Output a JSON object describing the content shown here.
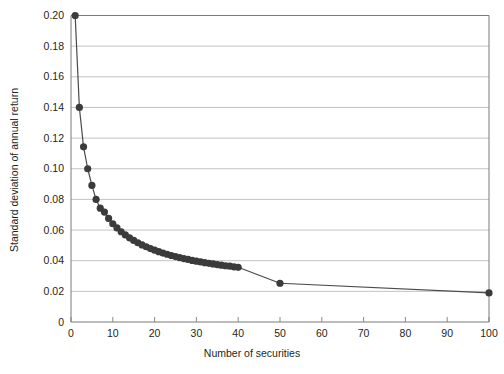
{
  "chart_data": {
    "type": "line",
    "title": "",
    "xlabel": "Number of securities",
    "ylabel": "Standard deviation of annual return",
    "xlim": [
      0,
      100
    ],
    "ylim": [
      0,
      0.2
    ],
    "grid": "horizontal",
    "legend": "none",
    "marker": "filled-circle",
    "marker_color": "#3b3b3b",
    "line_color": "#4a4a4a",
    "gridline_color": "#b3b3b3",
    "axis_color": "#7a7a7a",
    "background": "#ffffff",
    "xticks": [
      0,
      10,
      20,
      30,
      40,
      50,
      60,
      70,
      80,
      90,
      100
    ],
    "xtick_labels": [
      "0",
      "10",
      "20",
      "30",
      "40",
      "50",
      "60",
      "70",
      "80",
      "90",
      "100"
    ],
    "yticks": [
      0,
      0.02,
      0.04,
      0.06,
      0.08,
      0.1,
      0.12,
      0.14,
      0.16,
      0.18,
      0.2
    ],
    "ytick_labels": [
      "0",
      "0.02",
      "0.04",
      "0.06",
      "0.08",
      "0.10",
      "0.12",
      "0.14",
      "0.16",
      "0.18",
      "0.20"
    ],
    "x": [
      1,
      2,
      3,
      4,
      5,
      6,
      7,
      8,
      9,
      10,
      11,
      12,
      13,
      14,
      15,
      16,
      17,
      18,
      19,
      20,
      21,
      22,
      23,
      24,
      25,
      26,
      27,
      28,
      29,
      30,
      31,
      32,
      33,
      34,
      35,
      36,
      37,
      38,
      39,
      40,
      50,
      100
    ],
    "y": [
      0.2,
      0.14,
      0.1143,
      0.1,
      0.0891,
      0.08,
      0.0743,
      0.0717,
      0.0676,
      0.0641,
      0.0614,
      0.0589,
      0.0568,
      0.0549,
      0.0532,
      0.0517,
      0.0503,
      0.0491,
      0.0479,
      0.0469,
      0.0459,
      0.045,
      0.0442,
      0.0434,
      0.0427,
      0.042,
      0.0414,
      0.0408,
      0.0402,
      0.0397,
      0.0392,
      0.0387,
      0.0383,
      0.0379,
      0.0375,
      0.0371,
      0.0367,
      0.0364,
      0.036,
      0.0357,
      0.0253,
      0.019
    ],
    "series": [
      {
        "name": "Portfolio standard deviation",
        "x": [
          1,
          2,
          3,
          4,
          5,
          6,
          7,
          8,
          9,
          10,
          11,
          12,
          13,
          14,
          15,
          16,
          17,
          18,
          19,
          20,
          21,
          22,
          23,
          24,
          25,
          26,
          27,
          28,
          29,
          30,
          31,
          32,
          33,
          34,
          35,
          36,
          37,
          38,
          39,
          40,
          50,
          100
        ],
        "values": [
          0.2,
          0.14,
          0.1143,
          0.1,
          0.0891,
          0.08,
          0.0743,
          0.0717,
          0.0676,
          0.0641,
          0.0614,
          0.0589,
          0.0568,
          0.0549,
          0.0532,
          0.0517,
          0.0503,
          0.0491,
          0.0479,
          0.0469,
          0.0459,
          0.045,
          0.0442,
          0.0434,
          0.0427,
          0.042,
          0.0414,
          0.0408,
          0.0402,
          0.0397,
          0.0392,
          0.0387,
          0.0383,
          0.0379,
          0.0375,
          0.0371,
          0.0367,
          0.0364,
          0.036,
          0.0357,
          0.0253,
          0.019
        ]
      }
    ]
  }
}
